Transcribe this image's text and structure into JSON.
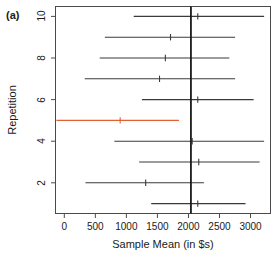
{
  "figure": {
    "panel_label": "(a)",
    "accent_color": "#e06030",
    "line_color": "#3a3a3a",
    "frame_color": "#4a4a4a"
  },
  "chart_data": {
    "type": "scatter",
    "title": "",
    "subtitle": "",
    "xlabel": "Sample Mean (in $s)",
    "ylabel": "Repetition",
    "xlim": [
      -150,
      3330
    ],
    "ylim": [
      0.5,
      10.5
    ],
    "grid": false,
    "legend": null,
    "xticks": [
      0,
      500,
      1000,
      1500,
      2000,
      2500,
      3000
    ],
    "xtick_labels": [
      "0",
      "500",
      "1000",
      "1500",
      "2000",
      "2500",
      "3000"
    ],
    "yticks": [
      2,
      4,
      6,
      8,
      10
    ],
    "ytick_labels": [
      "2",
      "4",
      "6",
      "8",
      "10"
    ],
    "reference_line": {
      "orientation": "vertical",
      "value": 2040,
      "label": "",
      "color": "#1a1a1a"
    },
    "series": [
      {
        "name": "Confidence intervals",
        "notes": "Horizontal confidence interval per repetition with a point estimate tick at the sample mean.",
        "points": [
          {
            "repetition": 1,
            "mean": 2150,
            "lower": 1400,
            "upper": 2920,
            "covers_reference": true,
            "color": "#3a3a3a"
          },
          {
            "repetition": 2,
            "mean": 1311,
            "lower": 341,
            "upper": 2249,
            "covers_reference": false,
            "color": "#3a3a3a"
          },
          {
            "repetition": 3,
            "mean": 2166,
            "lower": 1206,
            "upper": 3146,
            "covers_reference": true,
            "color": "#3a3a3a"
          },
          {
            "repetition": 4,
            "mean": 2060,
            "lower": 806,
            "upper": 3219,
            "covers_reference": true,
            "color": "#3a3a3a"
          },
          {
            "repetition": 5,
            "mean": 900,
            "lower": -127,
            "upper": 1847,
            "covers_reference": false,
            "color": "#e06030"
          },
          {
            "repetition": 6,
            "mean": 2150,
            "lower": 1250,
            "upper": 3050,
            "covers_reference": true,
            "color": "#3a3a3a"
          },
          {
            "repetition": 7,
            "mean": 1534,
            "lower": 329,
            "upper": 2752,
            "covers_reference": true,
            "color": "#3a3a3a"
          },
          {
            "repetition": 8,
            "mean": 1628,
            "lower": 571,
            "upper": 2659,
            "covers_reference": true,
            "color": "#3a3a3a"
          },
          {
            "repetition": 9,
            "mean": 1711,
            "lower": 653,
            "upper": 2752,
            "covers_reference": true,
            "color": "#3a3a3a"
          },
          {
            "repetition": 10,
            "mean": 2150,
            "lower": 1118,
            "upper": 3219,
            "covers_reference": true,
            "color": "#3a3a3a"
          }
        ]
      }
    ]
  }
}
